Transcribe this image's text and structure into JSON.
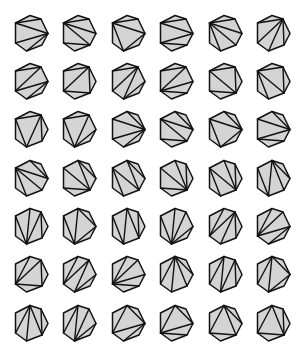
{
  "diagram": {
    "count": 42,
    "grid": {
      "rows": 7,
      "cols": 6,
      "col_centers": [
        31,
        79,
        128,
        176,
        225,
        273
      ],
      "row_centers": [
        33,
        81,
        129,
        178,
        226,
        274,
        323
      ]
    },
    "colors": {
      "fill": "#d4d4d4",
      "stroke": "#111111",
      "background": "#ffffff"
    },
    "heptagon_vertex_offsets": [
      [
        -1,
        -17.5
      ],
      [
        10,
        -14
      ],
      [
        17,
        0.5
      ],
      [
        11,
        12
      ],
      [
        -4.5,
        18
      ],
      [
        -15.5,
        10
      ],
      [
        -15.5,
        -10
      ]
    ],
    "triangulations": [
      [
        [
          1,
          6
        ],
        [
          2,
          6
        ],
        [
          2,
          4
        ],
        [
          2,
          5
        ]
      ],
      [
        [
          1,
          6
        ],
        [
          2,
          6
        ],
        [
          3,
          5
        ],
        [
          3,
          6
        ]
      ],
      [
        [
          1,
          6
        ],
        [
          2,
          6
        ],
        [
          4,
          6
        ],
        [
          4,
          2
        ]
      ],
      [
        [
          1,
          6
        ],
        [
          2,
          6
        ],
        [
          5,
          2
        ],
        [
          5,
          3
        ]
      ],
      [
        [
          1,
          6
        ],
        [
          2,
          6
        ],
        [
          6,
          3
        ],
        [
          6,
          4
        ]
      ],
      [
        [
          1,
          6
        ],
        [
          1,
          5
        ],
        [
          1,
          3
        ],
        [
          1,
          4
        ]
      ],
      [
        [
          1,
          6
        ],
        [
          1,
          5
        ],
        [
          2,
          4
        ],
        [
          2,
          5
        ]
      ],
      [
        [
          1,
          6
        ],
        [
          1,
          5
        ],
        [
          3,
          5
        ],
        [
          3,
          1
        ]
      ],
      [
        [
          1,
          6
        ],
        [
          1,
          5
        ],
        [
          4,
          1
        ],
        [
          4,
          2
        ]
      ],
      [
        [
          1,
          6
        ],
        [
          1,
          5
        ],
        [
          5,
          2
        ],
        [
          5,
          3
        ]
      ],
      [
        [
          1,
          6
        ],
        [
          1,
          3
        ],
        [
          3,
          6
        ],
        [
          3,
          5
        ]
      ],
      [
        [
          1,
          6
        ],
        [
          1,
          3
        ],
        [
          3,
          6
        ],
        [
          4,
          6
        ]
      ],
      [
        [
          1,
          6
        ],
        [
          1,
          4
        ],
        [
          4,
          6
        ],
        [
          1,
          3
        ]
      ],
      [
        [
          1,
          6
        ],
        [
          1,
          4
        ],
        [
          4,
          6
        ],
        [
          2,
          4
        ]
      ],
      [
        [
          0,
          2
        ],
        [
          2,
          6
        ],
        [
          2,
          4
        ],
        [
          2,
          5
        ]
      ],
      [
        [
          0,
          2
        ],
        [
          2,
          6
        ],
        [
          3,
          5
        ],
        [
          3,
          6
        ]
      ],
      [
        [
          0,
          2
        ],
        [
          2,
          6
        ],
        [
          4,
          6
        ],
        [
          4,
          2
        ]
      ],
      [
        [
          0,
          2
        ],
        [
          2,
          6
        ],
        [
          5,
          2
        ],
        [
          5,
          3
        ]
      ],
      [
        [
          0,
          2
        ],
        [
          2,
          6
        ],
        [
          6,
          3
        ],
        [
          6,
          4
        ]
      ],
      [
        [
          0,
          3
        ],
        [
          3,
          6
        ],
        [
          0,
          2
        ],
        [
          3,
          5
        ]
      ],
      [
        [
          0,
          3
        ],
        [
          3,
          6
        ],
        [
          0,
          2
        ],
        [
          4,
          6
        ]
      ],
      [
        [
          0,
          3
        ],
        [
          3,
          6
        ],
        [
          1,
          3
        ],
        [
          3,
          5
        ]
      ],
      [
        [
          0,
          3
        ],
        [
          3,
          6
        ],
        [
          1,
          3
        ],
        [
          4,
          6
        ]
      ],
      [
        [
          0,
          4
        ],
        [
          4,
          6
        ],
        [
          0,
          2
        ],
        [
          0,
          3
        ]
      ],
      [
        [
          0,
          4
        ],
        [
          4,
          6
        ],
        [
          1,
          3
        ],
        [
          1,
          4
        ]
      ],
      [
        [
          0,
          4
        ],
        [
          4,
          6
        ],
        [
          2,
          4
        ],
        [
          2,
          0
        ]
      ],
      [
        [
          0,
          4
        ],
        [
          4,
          6
        ],
        [
          3,
          0
        ],
        [
          3,
          1
        ]
      ],
      [
        [
          0,
          4
        ],
        [
          4,
          6
        ],
        [
          4,
          1
        ],
        [
          4,
          2
        ]
      ],
      [
        [
          0,
          5
        ],
        [
          1,
          5
        ],
        [
          1,
          3
        ],
        [
          1,
          4
        ]
      ],
      [
        [
          0,
          5
        ],
        [
          1,
          5
        ],
        [
          2,
          4
        ],
        [
          2,
          5
        ]
      ],
      [
        [
          0,
          5
        ],
        [
          1,
          5
        ],
        [
          3,
          5
        ],
        [
          3,
          1
        ]
      ],
      [
        [
          0,
          5
        ],
        [
          1,
          5
        ],
        [
          4,
          1
        ],
        [
          4,
          2
        ]
      ],
      [
        [
          0,
          5
        ],
        [
          1,
          5
        ],
        [
          5,
          2
        ],
        [
          5,
          3
        ]
      ],
      [
        [
          0,
          5
        ],
        [
          0,
          4
        ],
        [
          0,
          2
        ],
        [
          0,
          3
        ]
      ],
      [
        [
          0,
          5
        ],
        [
          0,
          4
        ],
        [
          1,
          3
        ],
        [
          1,
          4
        ]
      ],
      [
        [
          0,
          5
        ],
        [
          0,
          4
        ],
        [
          2,
          4
        ],
        [
          2,
          0
        ]
      ],
      [
        [
          0,
          5
        ],
        [
          0,
          4
        ],
        [
          3,
          0
        ],
        [
          3,
          1
        ]
      ],
      [
        [
          0,
          5
        ],
        [
          0,
          4
        ],
        [
          4,
          1
        ],
        [
          4,
          2
        ]
      ],
      [
        [
          0,
          5
        ],
        [
          0,
          2
        ],
        [
          2,
          5
        ],
        [
          2,
          4
        ]
      ],
      [
        [
          0,
          5
        ],
        [
          0,
          2
        ],
        [
          2,
          5
        ],
        [
          3,
          5
        ]
      ],
      [
        [
          0,
          5
        ],
        [
          0,
          3
        ],
        [
          3,
          5
        ],
        [
          0,
          2
        ]
      ],
      [
        [
          0,
          5
        ],
        [
          0,
          3
        ],
        [
          3,
          5
        ],
        [
          1,
          3
        ]
      ]
    ]
  }
}
